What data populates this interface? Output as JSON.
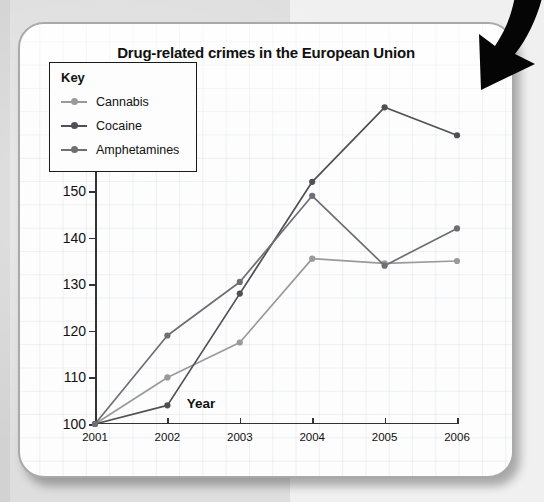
{
  "chart_data": {
    "type": "line",
    "title": "Drug-related crimes in the European Union",
    "xlabel": "Year",
    "ylabel": "Number of crimes (in thousands)",
    "categories": [
      "2001",
      "2002",
      "2003",
      "2004",
      "2005",
      "2006"
    ],
    "x": [
      2001,
      2002,
      2003,
      2004,
      2005,
      2006
    ],
    "xlim": [
      2001,
      2006
    ],
    "ylim": [
      100,
      170
    ],
    "yticks": [
      100,
      110,
      120,
      130,
      140,
      150,
      160,
      170
    ],
    "grid": true,
    "legend_position": "upper-left-inside",
    "legend_title": "Key",
    "series": [
      {
        "name": "Cannabis",
        "color": "#9a9a9a",
        "values": [
          100,
          110,
          117.5,
          135.5,
          134.5,
          135
        ]
      },
      {
        "name": "Cocaine",
        "color": "#4f4f55",
        "values": [
          100,
          104,
          128,
          152,
          168,
          162
        ]
      },
      {
        "name": "Amphetamines",
        "color": "#6e6e74",
        "values": [
          100,
          119,
          130.5,
          149,
          134,
          142
        ]
      }
    ]
  },
  "card": {
    "background": "#fdfdfd",
    "border_color": "#a9a9a9"
  },
  "annotation": {
    "arrow": "curved-down-right-arrow",
    "arrow_color": "#000000"
  },
  "page": {
    "background": "#dedede"
  }
}
